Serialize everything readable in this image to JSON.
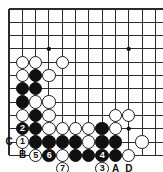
{
  "diagram": {
    "kind": "go-board-diagram",
    "corner": "upper-left",
    "board_size": 19,
    "colors": {
      "background": "#ffffff",
      "grid": "#2b2b2b",
      "black_stone": "#111111",
      "white_stone": "#ffffff",
      "stone_outline": "#1a1a1a",
      "label_text": "#111111"
    },
    "grid": {
      "origin_x": 9,
      "origin_y": 9,
      "spacing": 13.3,
      "cols": 12,
      "rows": 11,
      "show_grid": true
    },
    "hoshi_points": [
      {
        "col": 3,
        "row": 3
      },
      {
        "col": 9,
        "row": 3
      },
      {
        "col": 9,
        "row": 9
      }
    ],
    "stones": [
      {
        "color": "white",
        "col": 1,
        "row": 4,
        "label": ""
      },
      {
        "color": "white",
        "col": 2,
        "row": 4,
        "label": ""
      },
      {
        "color": "white",
        "col": 4,
        "row": 4,
        "label": ""
      },
      {
        "color": "white",
        "col": 1,
        "row": 5,
        "label": ""
      },
      {
        "color": "black",
        "col": 2,
        "row": 5,
        "label": ""
      },
      {
        "color": "white",
        "col": 3,
        "row": 5,
        "label": ""
      },
      {
        "color": "black",
        "col": 1,
        "row": 6,
        "label": ""
      },
      {
        "color": "black",
        "col": 2,
        "row": 6,
        "label": ""
      },
      {
        "color": "black",
        "col": 1,
        "row": 7,
        "label": ""
      },
      {
        "color": "white",
        "col": 2,
        "row": 7,
        "label": ""
      },
      {
        "color": "white",
        "col": 3,
        "row": 7,
        "label": ""
      },
      {
        "color": "white",
        "col": 1,
        "row": 8,
        "label": ""
      },
      {
        "color": "black",
        "col": 2,
        "row": 8,
        "label": ""
      },
      {
        "color": "white",
        "col": 3,
        "row": 8,
        "label": ""
      },
      {
        "color": "white",
        "col": 8,
        "row": 8,
        "label": ""
      },
      {
        "color": "white",
        "col": 9,
        "row": 8,
        "label": ""
      },
      {
        "color": "black",
        "col": 1,
        "row": 9,
        "label": "2"
      },
      {
        "color": "black",
        "col": 2,
        "row": 9,
        "label": ""
      },
      {
        "color": "white",
        "col": 3,
        "row": 9,
        "label": ""
      },
      {
        "color": "white",
        "col": 4,
        "row": 9,
        "label": ""
      },
      {
        "color": "white",
        "col": 5,
        "row": 9,
        "label": ""
      },
      {
        "color": "white",
        "col": 6,
        "row": 9,
        "label": ""
      },
      {
        "color": "black",
        "col": 7,
        "row": 9,
        "label": ""
      },
      {
        "color": "white",
        "col": 8,
        "row": 9,
        "label": ""
      },
      {
        "color": "white",
        "col": 1,
        "row": 10,
        "label": "1"
      },
      {
        "color": "black",
        "col": 2,
        "row": 10,
        "label": ""
      },
      {
        "color": "black",
        "col": 3,
        "row": 10,
        "label": ""
      },
      {
        "color": "black",
        "col": 4,
        "row": 10,
        "label": ""
      },
      {
        "color": "black",
        "col": 5,
        "row": 10,
        "label": ""
      },
      {
        "color": "white",
        "col": 6,
        "row": 10,
        "label": ""
      },
      {
        "color": "black",
        "col": 7,
        "row": 10,
        "label": ""
      },
      {
        "color": "black",
        "col": 8,
        "row": 10,
        "label": ""
      },
      {
        "color": "white",
        "col": 10,
        "row": 10,
        "label": ""
      },
      {
        "color": "white",
        "col": 2,
        "row": 11,
        "label": "5"
      },
      {
        "color": "black",
        "col": 3,
        "row": 11,
        "label": "6"
      },
      {
        "color": "white",
        "col": 4,
        "row": 11,
        "label": ""
      },
      {
        "color": "black",
        "col": 5,
        "row": 11,
        "label": ""
      },
      {
        "color": "black",
        "col": 6,
        "row": 11,
        "label": ""
      },
      {
        "color": "black",
        "col": 7,
        "row": 11,
        "label": "4"
      },
      {
        "color": "black",
        "col": 8,
        "row": 11,
        "label": ""
      },
      {
        "color": "white",
        "col": 9,
        "row": 11,
        "label": ""
      },
      {
        "color": "white",
        "col": 4,
        "row": 12,
        "label": "7"
      },
      {
        "color": "white",
        "col": 7,
        "row": 12,
        "label": "3"
      }
    ],
    "edge_labels": [
      {
        "text": "C",
        "col": 0,
        "row": 10,
        "side": "left"
      },
      {
        "text": "B",
        "col": 1,
        "row": 11,
        "side": "left"
      },
      {
        "text": "A",
        "col": 8,
        "row": 12,
        "side": "bottom"
      },
      {
        "text": "D",
        "col": 9,
        "row": 12,
        "side": "bottom"
      }
    ],
    "move_sequence": [
      "1",
      "2",
      "3",
      "4",
      "5",
      "6",
      "7"
    ],
    "point_markers": [
      "A",
      "B",
      "C",
      "D"
    ]
  }
}
